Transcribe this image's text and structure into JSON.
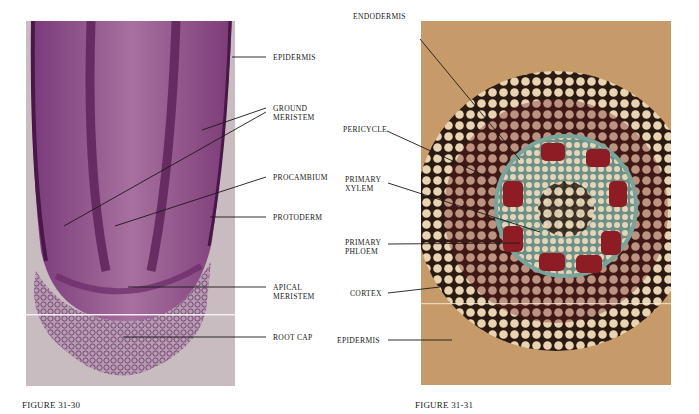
{
  "figures": [
    {
      "id": "fig-31-30",
      "caption": "FIGURE 31-30",
      "subject": "longitudinal section of root tip",
      "colors": {
        "background": "#c9bcc1",
        "tissue": "#8a4a86",
        "dark": "#5b1f58"
      },
      "labels": [
        {
          "text": "EPIDERMIS"
        },
        {
          "text": "GROUND\nMERISTEM"
        },
        {
          "text": "PROCAMBIUM"
        },
        {
          "text": "PROTODERM"
        },
        {
          "text": "APICAL\nMERISTEM"
        },
        {
          "text": "ROOT CAP"
        }
      ]
    },
    {
      "id": "fig-31-31",
      "caption": "FIGURE 31-31",
      "subject": "cross section of root",
      "colors": {
        "background": "#c79a6a",
        "cells": "#e6d2b0",
        "walls": "#2a1a12",
        "xylem": "#8e1c24",
        "stele": "#6c9a95"
      },
      "labels": [
        {
          "text": "ENDODERMIS"
        },
        {
          "text": "PERICYCLE"
        },
        {
          "text": "PRIMARY\nXYLEM"
        },
        {
          "text": "PRIMARY\nPHLOEM"
        },
        {
          "text": "CORTEX"
        },
        {
          "text": "EPIDERMIS"
        }
      ]
    }
  ]
}
